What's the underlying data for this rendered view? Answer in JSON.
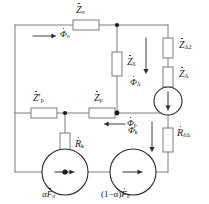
{
  "figure": {
    "type": "electrical-schematic",
    "title": "",
    "background_color": "#ffffff",
    "line_color": "#6e6e6e",
    "text_color": "#1a1a1a",
    "width": 209,
    "height": 204
  },
  "components": {
    "z_sigma_top": {
      "id": "Z-sigma-top",
      "symbol": "Z",
      "subscript": "σ",
      "dotted": true,
      "orientation": "horizontal",
      "label": "Żσ"
    },
    "z_delta_series": {
      "id": "Z-delta",
      "symbol": "Z",
      "subscript": "δ",
      "dotted": true,
      "orientation": "vertical",
      "label": "Żδ"
    },
    "z_delta2": {
      "id": "Z-Delta2",
      "symbol": "Z",
      "subscript": "Δ2",
      "dotted": true,
      "orientation": "vertical",
      "label": "ŻΔ2"
    },
    "z_delta": {
      "id": "Z-Delta",
      "symbol": "Z",
      "subscript": "Δ",
      "dotted": true,
      "orientation": "vertical",
      "label": "ŻΔ"
    },
    "z_p_prime": {
      "id": "Z-p-prime",
      "symbol": "Z′",
      "subscript": "p",
      "dotted": true,
      "orientation": "horizontal",
      "label": "Ż′p"
    },
    "z_p": {
      "id": "Z-p",
      "symbol": "Z",
      "subscript": "p",
      "dotted": true,
      "orientation": "horizontal",
      "label": "Żp"
    },
    "r_k": {
      "id": "R-k",
      "symbol": "R",
      "subscript": "k",
      "dotted": true,
      "orientation": "vertical",
      "label": "Ṙk"
    },
    "r_delta_delta": {
      "id": "R-delta-Delta",
      "symbol": "R",
      "subscript": "δΔ",
      "dotted": true,
      "orientation": "vertical",
      "label": "ṘδΔ"
    }
  },
  "sources": {
    "left": {
      "id": "source-alpha-F",
      "label_prefix": "α",
      "label_symbol": "F",
      "label_subscript": "σ",
      "dotted": true,
      "shape": "circle",
      "arrow_direction": "right"
    },
    "middle": {
      "id": "source-one-minus-alpha-F",
      "label_prefix": "(1−α)",
      "label_symbol": "F",
      "label_subscript": "σ",
      "dotted": true,
      "shape": "circle",
      "arrow_direction": "right"
    },
    "right": {
      "id": "source-delta-branch",
      "label_prefix": "",
      "label_symbol": "",
      "label_subscript": "",
      "dotted": false,
      "shape": "circle",
      "arrow_direction": "down"
    }
  },
  "flux_arrows": {
    "phi_sigma_top": {
      "id": "phi-sigma",
      "symbol": "Φ",
      "subscript": "σ",
      "dotted": true,
      "direction": "right",
      "label": "Φ̇σ"
    },
    "phi_sigma_mid": {
      "id": "phi-sigma-mid",
      "symbol": "Φ",
      "subscript": "p",
      "dotted": true,
      "direction": "left",
      "label": "Φ̇p"
    },
    "phi_delta": {
      "id": "phi-Delta",
      "symbol": "Φ",
      "subscript": "Δ",
      "dotted": true,
      "direction": "down",
      "label": "Φ̇Δ"
    },
    "phi_k": {
      "id": "phi-k",
      "symbol": "Φ",
      "subscript": "k",
      "dotted": true,
      "direction": "down",
      "label": "Φ̇k"
    }
  },
  "nodes": [
    {
      "id": "node-top-center",
      "x": 117,
      "y": 25
    },
    {
      "id": "node-mid-center",
      "x": 117,
      "y": 113
    },
    {
      "id": "node-mid-left",
      "x": 65,
      "y": 113
    },
    {
      "id": "node-bottom-left",
      "x": 65,
      "y": 172
    }
  ]
}
